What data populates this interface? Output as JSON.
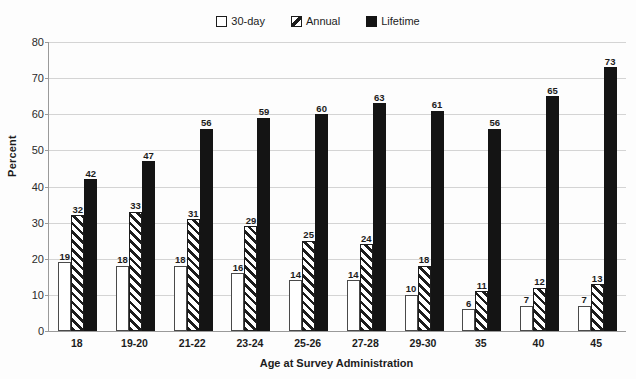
{
  "chart_data": {
    "type": "bar",
    "title": "",
    "xlabel": "Age at Survey Administration",
    "ylabel": "Percent",
    "ylim": [
      0,
      80
    ],
    "yticks": [
      0,
      10,
      20,
      30,
      40,
      50,
      60,
      70,
      80
    ],
    "grid": true,
    "legend_position": "top-center",
    "categories": [
      "18",
      "19-20",
      "21-22",
      "23-24",
      "25-26",
      "27-28",
      "29-30",
      "35",
      "40",
      "45"
    ],
    "series": [
      {
        "name": "30-day",
        "values": [
          19,
          18,
          18,
          16,
          14,
          14,
          10,
          6,
          7,
          7
        ],
        "style": "open",
        "color": "#ffffff"
      },
      {
        "name": "Annual",
        "values": [
          32,
          33,
          31,
          29,
          25,
          24,
          18,
          11,
          12,
          13
        ],
        "style": "hatched",
        "color": "#1c1c1c"
      },
      {
        "name": "Lifetime",
        "values": [
          42,
          47,
          56,
          59,
          60,
          63,
          61,
          56,
          65,
          73
        ],
        "style": "solid",
        "color": "#141414"
      }
    ]
  },
  "legend": {
    "items": [
      {
        "label": "30-day",
        "swatch": "open-square-icon"
      },
      {
        "label": "Annual",
        "swatch": "hatched-square-icon"
      },
      {
        "label": "Lifetime",
        "swatch": "filled-square-icon"
      }
    ]
  },
  "axes": {
    "y_title": "Percent",
    "x_title": "Age at Survey Administration"
  }
}
